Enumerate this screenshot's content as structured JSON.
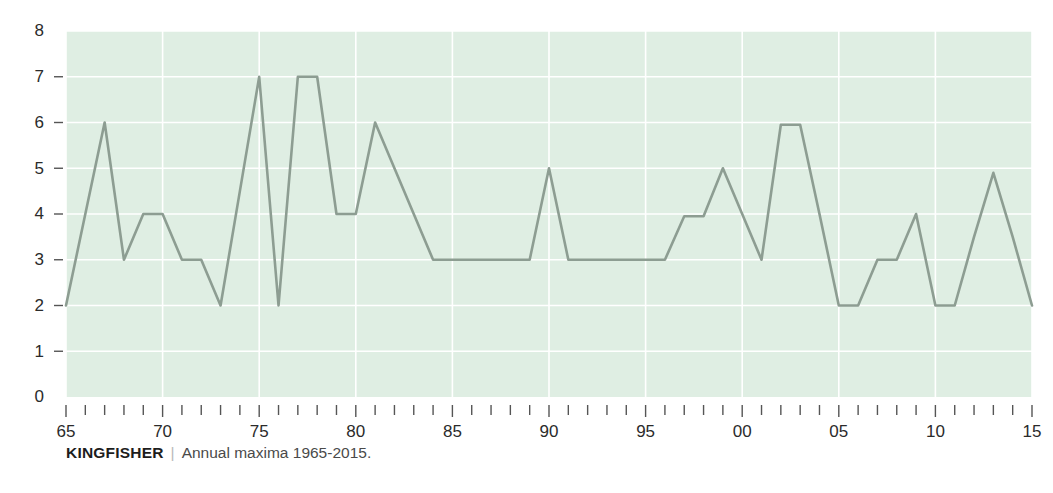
{
  "caption": {
    "series_name": "KINGFISHER",
    "separator": "|",
    "description": "Annual maxima 1965-2015."
  },
  "colors": {
    "plot_background": "#dfeee3",
    "gridline": "#ffffff",
    "line": "#8d9d92",
    "tick_label": "#2b2b2b",
    "tick_mark": "#555555",
    "caption_name": "#1d1d1d",
    "caption_text": "#4a4a4a",
    "page_background": "#ffffff"
  },
  "chart_data": {
    "type": "line",
    "title": "",
    "subtitle": "",
    "xlabel": "",
    "ylabel": "",
    "xlim": [
      1965,
      2015
    ],
    "ylim": [
      0,
      8
    ],
    "grid": true,
    "legend": "none",
    "y_ticks": [
      0,
      1,
      2,
      3,
      4,
      5,
      6,
      7,
      8
    ],
    "y_tick_labels": [
      "0",
      "1",
      "2",
      "3",
      "4",
      "5",
      "6",
      "7",
      "8"
    ],
    "x_ticks": [
      1965,
      1970,
      1975,
      1980,
      1985,
      1990,
      1995,
      2000,
      2005,
      2010,
      2015
    ],
    "x_tick_labels": [
      "65",
      "70",
      "75",
      "80",
      "85",
      "90",
      "95",
      "00",
      "05",
      "10",
      "15"
    ],
    "x_minor_ticks_every": 1,
    "series": [
      {
        "name": "KINGFISHER",
        "x": [
          1965,
          1966,
          1967,
          1968,
          1969,
          1970,
          1971,
          1972,
          1973,
          1974,
          1975,
          1976,
          1977,
          1978,
          1979,
          1980,
          1981,
          1982,
          1983,
          1984,
          1985,
          1986,
          1987,
          1988,
          1989,
          1990,
          1991,
          1992,
          1993,
          1994,
          1995,
          1996,
          1997,
          1998,
          1999,
          2000,
          2001,
          2002,
          2003,
          2004,
          2005,
          2006,
          2007,
          2008,
          2009,
          2010,
          2011,
          2012,
          2013,
          2014,
          2015
        ],
        "values": [
          2,
          4,
          6,
          3,
          4,
          4,
          3,
          3,
          2,
          4.5,
          7,
          2,
          7,
          7,
          4,
          4,
          6,
          5,
          4,
          3,
          3,
          3,
          3,
          3,
          3,
          5,
          3,
          3,
          3,
          3,
          3,
          3,
          3.95,
          3.95,
          5,
          4,
          3,
          5.95,
          5.95,
          4,
          2,
          2,
          3,
          3,
          4,
          2,
          2,
          3.5,
          4.9,
          3.5,
          2
        ]
      }
    ]
  }
}
